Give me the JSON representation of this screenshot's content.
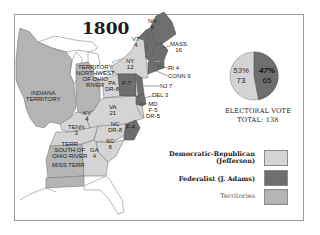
{
  "title": "1800",
  "colors": {
    "democratic_republican": "#d4d4d4",
    "federalist": "#6e6e6e",
    "territories": "#b4b4b4",
    "background": "#ffffff",
    "outline": "#8a8a8a"
  },
  "regions": [
    {
      "id": "nh",
      "label": "NH",
      "votes": "6",
      "party": "federalist"
    },
    {
      "id": "vt",
      "label": "VT",
      "votes": "4",
      "party": "federalist"
    },
    {
      "id": "mass",
      "label": "MASS",
      "votes": "16",
      "party": "federalist"
    },
    {
      "id": "ri",
      "label": "RI",
      "votes": "4",
      "party": "federalist"
    },
    {
      "id": "conn",
      "label": "CONN",
      "votes": "9",
      "party": "federalist"
    },
    {
      "id": "ny",
      "label": "NY",
      "votes": "12",
      "party": "democratic_republican"
    },
    {
      "id": "nj",
      "label": "NJ",
      "votes": "7",
      "party": "federalist"
    },
    {
      "id": "del",
      "label": "DEL",
      "votes": "3",
      "party": "federalist"
    },
    {
      "id": "pa",
      "label": "PA",
      "votes": "DR-8 F-7",
      "party": "split"
    },
    {
      "id": "md",
      "label": "MD",
      "votes": "F-5 DR-5",
      "party": "split"
    },
    {
      "id": "va",
      "label": "VA",
      "votes": "21",
      "party": "democratic_republican"
    },
    {
      "id": "nc",
      "label": "NC",
      "votes": "DR-8 F-4",
      "party": "split"
    },
    {
      "id": "sc",
      "label": "SC",
      "votes": "8",
      "party": "democratic_republican"
    },
    {
      "id": "ga",
      "label": "GA",
      "votes": "4",
      "party": "democratic_republican"
    },
    {
      "id": "ky",
      "label": "KY",
      "votes": "4",
      "party": "democratic_republican"
    },
    {
      "id": "tenn",
      "label": "TENN",
      "votes": "3",
      "party": "democratic_republican"
    },
    {
      "id": "nw_terr",
      "label": "TERRITORY NORTHWEST OF OHIO RIVER",
      "votes": "",
      "party": "territories"
    },
    {
      "id": "indiana",
      "label": "INDIANA TERRITORY",
      "votes": "",
      "party": "territories"
    },
    {
      "id": "s_terr",
      "label": "TERR SOUTH OF OHIO RIVER",
      "votes": "",
      "party": "territories"
    },
    {
      "id": "miss",
      "label": "MISS TERR",
      "votes": "",
      "party": "territories"
    }
  ],
  "labels": {
    "vt": [
      "VT",
      "4"
    ],
    "nh": [
      "NH",
      "6"
    ],
    "mass": [
      "MASS",
      "16"
    ],
    "ny": [
      "NY",
      "12"
    ],
    "ri": "RI 4",
    "conn": "CONN 9",
    "nj": "NJ 7",
    "del": "DEL 3",
    "md": [
      "MD",
      "F-5",
      "DR-5"
    ],
    "pa": [
      "PA",
      "DR-8"
    ],
    "pa_f": "F-7",
    "va": [
      "VA",
      "21"
    ],
    "nc": [
      "NC",
      "DR-8"
    ],
    "nc_f": "F-4",
    "sc": [
      "SC",
      "8"
    ],
    "ga": [
      "GA",
      "4"
    ],
    "ky": [
      "KY",
      "4"
    ],
    "tenn": [
      "TENN",
      "3"
    ],
    "nw_terr": [
      "TERRITORY",
      "NORTHWEST",
      "OF OHIO",
      "RIVER"
    ],
    "indiana": [
      "INDIANA",
      "TERRITORY"
    ],
    "s_terr": [
      "TERR",
      "SOUTH OF",
      "OHIO RIVER"
    ],
    "miss": "MISS TERR"
  },
  "pie": {
    "dr_pct": "53%",
    "dr_votes": "73",
    "fed_pct": "47%",
    "fed_votes": "65"
  },
  "electoral_vote": {
    "line1": "ELECTORAL  VOTE",
    "line2": "TOTAL: 138"
  },
  "legend": [
    {
      "label_line1": "Democratic-Republican",
      "label_line2": "(Jefferson)",
      "color": "#d4d4d4"
    },
    {
      "label_line1": "Federalist (J. Adams)",
      "label_line2": "",
      "color": "#6e6e6e"
    },
    {
      "label_line1": "Territories",
      "label_line2": "",
      "color": "#b4b4b4"
    }
  ]
}
